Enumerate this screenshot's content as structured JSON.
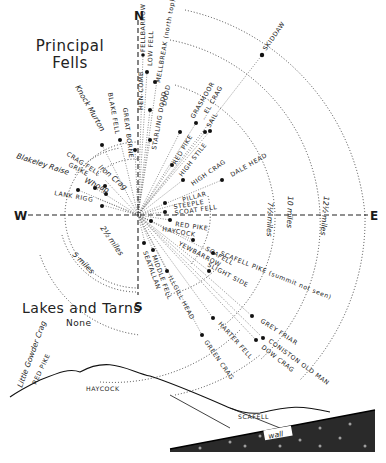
{
  "headings": {
    "principal_fells_line1": "Principal",
    "principal_fells_line2": "Fells",
    "lakes_and_tarns": "Lakes and Tarns",
    "lakes_and_tarns_value": "None"
  },
  "compass": {
    "north": "N",
    "south": "S",
    "east": "E",
    "west": "W"
  },
  "distance_rings": [
    {
      "label": "2½ miles"
    },
    {
      "label": "5 miles"
    },
    {
      "label": "7½ miles"
    },
    {
      "label": "10 miles"
    },
    {
      "label": "12½ miles"
    }
  ],
  "fells": [
    {
      "name": "SKIDDAW"
    },
    {
      "name": "FELLBARROW"
    },
    {
      "name": "LOW FELL"
    },
    {
      "name": "MELLBREAK (north top)"
    },
    {
      "name": "DODD"
    },
    {
      "name": "GRASMOOR"
    },
    {
      "name": "HOPEGILL HEAD",
      "partial": "…EL CRAG"
    },
    {
      "name": "SAIL"
    },
    {
      "name": "HEN COMB"
    },
    {
      "name": "STARLING DODD"
    },
    {
      "name": "GREAT BORNE"
    },
    {
      "name": "BLAKE FELL"
    },
    {
      "name": "Knock Murton"
    },
    {
      "name": "RED PIKE"
    },
    {
      "name": "HIGH STILE"
    },
    {
      "name": "HIGH CRAG"
    },
    {
      "name": "DALE HEAD"
    },
    {
      "name": "PILLAR"
    },
    {
      "name": "STEEPLE"
    },
    {
      "name": "SCOAT FELL"
    },
    {
      "name": "RED PIKE"
    },
    {
      "name": "HAYCOCK"
    },
    {
      "name": "CRAG FELL"
    },
    {
      "name": "Iron Crag"
    },
    {
      "name": "GRIKE"
    },
    {
      "name": "Whoap"
    },
    {
      "name": "Blakeley Raise"
    },
    {
      "name": "LANK RIGG"
    },
    {
      "name": "YEWBARROW"
    },
    {
      "name": "SCAFELL"
    },
    {
      "name": "SLIGHT SIDE"
    },
    {
      "name": "SCAFELL PIKE (summit not seen)"
    },
    {
      "name": "SEATALLAN"
    },
    {
      "name": "MIDDLE FELL"
    },
    {
      "name": "ILLGILL HEAD"
    },
    {
      "name": "HARTER FELL"
    },
    {
      "name": "GREEN CRAG"
    },
    {
      "name": "GREY FRIAR"
    },
    {
      "name": "CONISTON OLD MAN"
    },
    {
      "name": "DOW CRAG"
    }
  ],
  "panorama_sketch": {
    "labels": {
      "little_gowder_crag": "Little Gowder Crag",
      "red_pike": "RED PIKE",
      "haycock": "HAYCOCK",
      "scafell": "SCAFELL",
      "wall": "wall"
    }
  }
}
